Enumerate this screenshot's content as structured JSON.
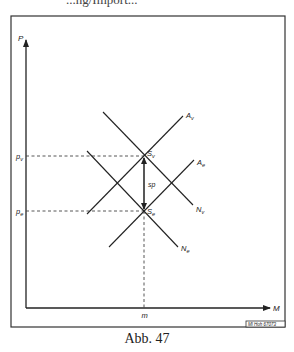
{
  "page": {
    "top_cut_text": "...ng/Import...",
    "caption": "Abb. 47"
  },
  "diagram": {
    "axes": {
      "y_label": "P",
      "x_label": "M",
      "y_ticks": [
        {
          "label": "p_v",
          "main": "p",
          "sub": "v"
        },
        {
          "label": "p_e",
          "main": "p",
          "sub": "e"
        }
      ],
      "x_ticks": [
        {
          "label": "m"
        }
      ]
    },
    "curves": [
      {
        "id": "Av",
        "main": "A",
        "sub": "v",
        "type": "supply"
      },
      {
        "id": "Ae",
        "main": "A",
        "sub": "e",
        "type": "supply"
      },
      {
        "id": "Nv",
        "main": "N",
        "sub": "v",
        "type": "demand"
      },
      {
        "id": "Ne",
        "main": "N",
        "sub": "e",
        "type": "demand"
      }
    ],
    "points": [
      {
        "id": "Sv",
        "main": "S",
        "sub": "v"
      },
      {
        "id": "Se",
        "main": "S",
        "sub": "e"
      }
    ],
    "spread_label": "sp",
    "stamp": "Ml Hoh 67073"
  }
}
